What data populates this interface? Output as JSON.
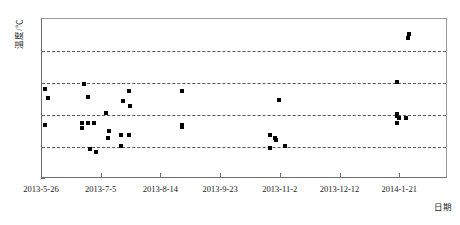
{
  "chart_data": {
    "type": "scatter",
    "title": "",
    "xlabel": "日期",
    "ylabel": "温度/℃",
    "grid": true,
    "legend": null,
    "ylim": [
      10,
      35
    ],
    "yticks": [
      10,
      15,
      20,
      25,
      30,
      35
    ],
    "gridlines_at": [
      15,
      20,
      25,
      30
    ],
    "xticks": [
      "2013-5-26",
      "2013-7-5",
      "2013-8-14",
      "2013-9-23",
      "2013-11-2",
      "2013-12-12",
      "2014-1-21"
    ],
    "xlim": [
      "2013-5-26",
      "2014-2-22"
    ],
    "x_tick_interval_days": 40,
    "marker": "filled-square",
    "marker_color": "#000000",
    "point_count": 38,
    "x_unit": "days since 2013-5-26",
    "points": [
      {
        "x_label": "2013-5-28",
        "x_days": 2,
        "y": 24.1
      },
      {
        "x_label": "2013-5-30",
        "x_days": 4,
        "y": 22.6
      },
      {
        "x_label": "2013-5-28",
        "x_days": 2,
        "y": 18.4
      },
      {
        "x_label": "2013-6-23",
        "x_days": 28,
        "y": 24.9
      },
      {
        "x_label": "2013-6-26",
        "x_days": 31,
        "y": 22.8
      },
      {
        "x_label": "2013-6-22",
        "x_days": 27,
        "y": 18.7
      },
      {
        "x_label": "2013-6-22",
        "x_days": 27,
        "y": 17.9
      },
      {
        "x_label": "2013-6-26",
        "x_days": 31,
        "y": 18.7
      },
      {
        "x_label": "2013-6-30",
        "x_days": 35,
        "y": 18.7
      },
      {
        "x_label": "2013-6-27",
        "x_days": 32,
        "y": 14.7
      },
      {
        "x_label": "2013-7-1",
        "x_days": 36,
        "y": 14.2
      },
      {
        "x_label": "2013-7-8",
        "x_days": 43,
        "y": 20.3
      },
      {
        "x_label": "2013-7-10",
        "x_days": 45,
        "y": 17.5
      },
      {
        "x_label": "2013-7-9",
        "x_days": 44,
        "y": 16.4
      },
      {
        "x_label": "2013-7-19",
        "x_days": 54,
        "y": 22.2
      },
      {
        "x_label": "2013-7-23",
        "x_days": 58,
        "y": 23.7
      },
      {
        "x_label": "2013-7-24",
        "x_days": 59,
        "y": 21.4
      },
      {
        "x_label": "2013-7-18",
        "x_days": 53,
        "y": 16.8
      },
      {
        "x_label": "2013-7-23",
        "x_days": 58,
        "y": 16.9
      },
      {
        "x_label": "2013-7-18",
        "x_days": 53,
        "y": 15.2
      },
      {
        "x_label": "2013-8-28",
        "x_days": 94,
        "y": 23.7
      },
      {
        "x_label": "2013-8-28",
        "x_days": 94,
        "y": 18.4
      },
      {
        "x_label": "2013-8-28",
        "x_days": 94,
        "y": 18.1
      },
      {
        "x_label": "2013-10-26",
        "x_days": 153,
        "y": 16.8
      },
      {
        "x_label": "2013-10-29",
        "x_days": 156,
        "y": 16.4
      },
      {
        "x_label": "2013-10-30",
        "x_days": 157,
        "y": 16.1
      },
      {
        "x_label": "2013-10-26",
        "x_days": 153,
        "y": 14.9
      },
      {
        "x_label": "2013-11-5",
        "x_days": 163,
        "y": 15.2
      },
      {
        "x_label": "2013-11-1",
        "x_days": 159,
        "y": 22.3
      },
      {
        "x_label": "2014-1-19",
        "x_days": 238,
        "y": 25.1
      },
      {
        "x_label": "2014-1-19",
        "x_days": 238,
        "y": 20.2
      },
      {
        "x_label": "2014-1-19",
        "x_days": 238,
        "y": 19.9
      },
      {
        "x_label": "2014-1-20",
        "x_days": 239,
        "y": 19.6
      },
      {
        "x_label": "2014-1-19",
        "x_days": 238,
        "y": 18.7
      },
      {
        "x_label": "2014-1-25",
        "x_days": 244,
        "y": 19.6
      },
      {
        "x_label": "2014-1-27",
        "x_days": 246,
        "y": 32.7
      },
      {
        "x_label": "2014-1-26",
        "x_days": 245,
        "y": 32.0
      }
    ]
  }
}
